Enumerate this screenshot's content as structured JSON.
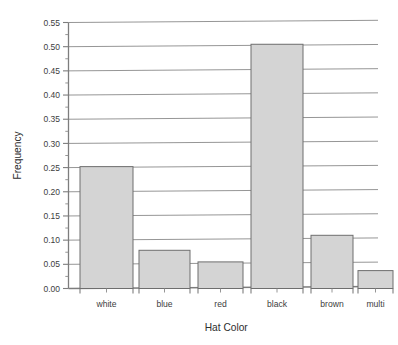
{
  "chart_data": {
    "type": "bar",
    "title": "",
    "subtitle": "",
    "xlabel": "Hat Color",
    "ylabel": "Frequency",
    "categories": [
      "white",
      "blue",
      "red",
      "black",
      "brown",
      "multi"
    ],
    "values": [
      0.252,
      0.079,
      0.055,
      0.505,
      0.11,
      0.037
    ],
    "ylim": [
      0.0,
      0.55
    ],
    "ytick_step": 0.05,
    "ytick_labels": [
      "0.00",
      "0.05",
      "0.10",
      "0.15",
      "0.20",
      "0.25",
      "0.30",
      "0.35",
      "0.40",
      "0.45",
      "0.50",
      "0.55"
    ],
    "ytick_values": [
      0.0,
      0.05,
      0.1,
      0.15,
      0.2,
      0.25,
      0.3,
      0.35,
      0.4,
      0.45,
      0.5,
      0.55
    ],
    "minor_ticks": true,
    "grid": "horizontal",
    "legend": "none",
    "bar_fill_color": "#d4d4d4",
    "bar_edge_color": "#6e6e6e",
    "gridline_color": "#8a8a8a",
    "axis_color": "#7d7d7d",
    "background_color": "#ffffff"
  }
}
